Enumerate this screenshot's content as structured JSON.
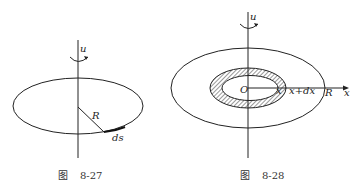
{
  "figures": [
    {
      "id": "8-27",
      "caption_prefix": "图",
      "caption_number": "8-27",
      "labels": {
        "rotation": "u",
        "radius": "R",
        "arc_element": "ds"
      }
    },
    {
      "id": "8-28",
      "caption_prefix": "图",
      "caption_number": "8-28",
      "labels": {
        "rotation": "u",
        "origin": "O",
        "inner_radius": "x",
        "outer_ring": "x+dx",
        "radius": "R",
        "axis": "x"
      }
    }
  ],
  "colors": {
    "stroke": "#222222",
    "background": "#ffffff"
  }
}
